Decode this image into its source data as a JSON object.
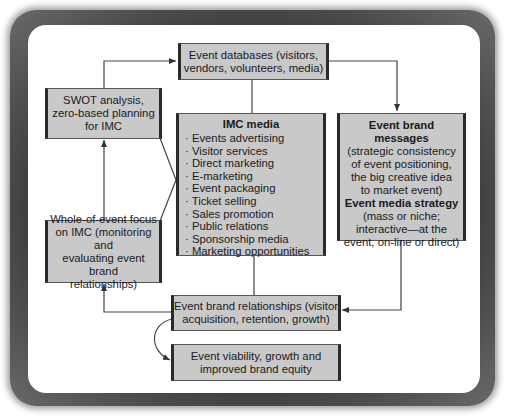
{
  "diagram": {
    "nodes": {
      "event_databases": {
        "lines": [
          "Event databases (visitors,",
          "vendors, volunteers, media)"
        ]
      },
      "swot": {
        "lines": [
          "SWOT analysis,",
          "zero-based planning",
          "for IMC"
        ]
      },
      "imc_media": {
        "title": "IMC media",
        "items": [
          "Events advertising",
          "Visitor services",
          "Direct marketing",
          "E-marketing",
          "Event packaging",
          "Ticket selling",
          "Sales promotion",
          "Public relations",
          "Sponsorship media",
          "Marketing opportunities"
        ]
      },
      "event_brand_messages": {
        "title": "Event brand messages",
        "lines": [
          "(strategic consistency",
          "of event positioning,",
          "the big creative idea",
          "to market event)"
        ],
        "title2": "Event media strategy",
        "lines2": [
          "(mass or niche;",
          "interactive—at the",
          "event, on-line or direct)"
        ]
      },
      "whole_of_event": {
        "lines": [
          "Whole-of-event focus",
          "on IMC (monitoring and",
          "evaluating event brand",
          "relationships)"
        ]
      },
      "event_brand_relationships": {
        "lines": [
          "Event brand relationships (visitor",
          "acquisition, retention, growth)"
        ]
      },
      "event_viability": {
        "lines": [
          "Event viability, growth and",
          "improved brand equity"
        ]
      }
    },
    "edges": [
      {
        "from": "swot",
        "to": "event_databases",
        "arrow": true
      },
      {
        "from": "event_databases",
        "to": "event_brand_messages",
        "arrow": true
      },
      {
        "from": "event_databases",
        "to": "imc_media",
        "arrow": false
      },
      {
        "from": "swot",
        "to": "imc_media",
        "arrow": false
      },
      {
        "from": "whole_of_event",
        "to": "imc_media",
        "arrow": false
      },
      {
        "from": "whole_of_event",
        "to": "swot",
        "arrow": true
      },
      {
        "from": "imc_media",
        "to": "event_brand_relationships",
        "arrow": false
      },
      {
        "from": "event_brand_messages",
        "to": "event_brand_relationships",
        "arrow": true
      },
      {
        "from": "event_brand_relationships",
        "to": "whole_of_event",
        "arrow": true
      },
      {
        "from": "event_brand_relationships",
        "to": "event_viability",
        "arrow": true
      }
    ],
    "colors": {
      "box_fill": "#c9c9c9",
      "box_border": "#2a2a2a",
      "frame": "#3a3a3a",
      "line": "#333333"
    }
  }
}
